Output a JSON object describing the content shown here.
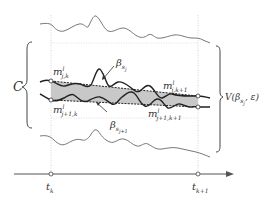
{
  "diagram": {
    "labels": {
      "C": "C",
      "m_j_k": {
        "base": "m",
        "sup": "l",
        "sub": "j,k"
      },
      "m_j_k1": {
        "base": "m",
        "sup": "l",
        "sub": "j,k+1"
      },
      "m_j1_k": {
        "base": "m",
        "sup": "l",
        "sub": "j+1,k"
      },
      "m_j1_k1": {
        "base": "m",
        "sup": "l",
        "sub": "j+1,k+1"
      },
      "beta_sj": {
        "base": "β",
        "sub": "s",
        "subsub": "j"
      },
      "beta_sj1": {
        "base": "β",
        "sub": "s",
        "subsub": "j+1"
      },
      "V": {
        "prefix": "V(β",
        "sub": "s",
        "subsub": "j",
        "suffix": ", ε)"
      },
      "t_k": {
        "base": "t",
        "sub": "k"
      },
      "t_k1": {
        "base": "t",
        "sub": "k+1"
      }
    },
    "colors": {
      "curve": "#333333",
      "envelope": "#777777",
      "band_fill": "#c8c8c8",
      "guide": "#bbbbbb",
      "axis": "#555555"
    }
  }
}
